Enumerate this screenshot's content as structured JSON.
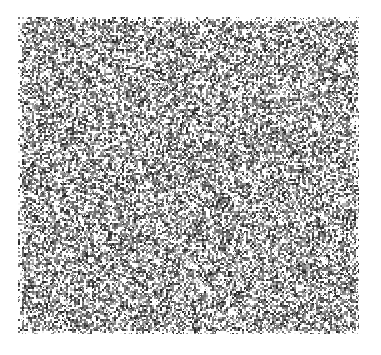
{
  "page": {
    "width": 381,
    "height": 355,
    "background_color": "#ffffff"
  },
  "noise_field": {
    "name": "random-grayscale-noise-plate",
    "description": "Square field of random grayscale speckle / static",
    "x": 18,
    "y": 17,
    "width": 341,
    "height": 317,
    "cell_size": 2,
    "seed": 20240517,
    "palette": [
      "#ffffff",
      "#f2f2f2",
      "#b5b5b5",
      "#8c8c8c",
      "#6e6e6e",
      "#4a4a4a",
      "#2b2b2b"
    ],
    "palette_weights": [
      0.3,
      0.1,
      0.1,
      0.16,
      0.14,
      0.12,
      0.08
    ],
    "edge_fade": true,
    "edge_fade_px": 4
  },
  "margins": {
    "top": 17,
    "bottom": 21,
    "left": 18,
    "right": 22,
    "color": "#ffffff"
  }
}
